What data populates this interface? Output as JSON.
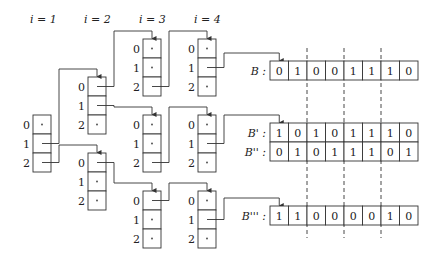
{
  "column_headers": [
    "i = 1",
    "i = 2",
    "i = 3",
    "i = 4"
  ],
  "slot_labels": [
    "0",
    "1",
    "2"
  ],
  "cell_placeholder": "·",
  "arrays": [
    {
      "name": "B",
      "label": "B :",
      "bits": [
        "0",
        "1",
        "0",
        "0",
        "1",
        "1",
        "1",
        "0"
      ]
    },
    {
      "name": "B'",
      "label": "B' :",
      "bits": [
        "1",
        "0",
        "1",
        "0",
        "1",
        "1",
        "1",
        "0"
      ]
    },
    {
      "name": "B''",
      "label": "B'' :",
      "bits": [
        "0",
        "1",
        "0",
        "1",
        "1",
        "1",
        "0",
        "1"
      ]
    },
    {
      "name": "B'''",
      "label": "B''' :",
      "bits": [
        "1",
        "1",
        "0",
        "0",
        "0",
        "0",
        "1",
        "0"
      ]
    }
  ],
  "nodes": [
    {
      "id": "n1",
      "column": 1,
      "pointers": {
        "1": "n2a",
        "2": "n2b"
      }
    },
    {
      "id": "n2a",
      "column": 2,
      "pointers": {
        "0": "n3a",
        "1": "n3b"
      }
    },
    {
      "id": "n2b",
      "column": 2,
      "pointers": {
        "0": "n3c"
      }
    },
    {
      "id": "n3a",
      "column": 3,
      "pointers": {
        "2": "n4a"
      }
    },
    {
      "id": "n3b",
      "column": 3,
      "pointers": {
        "2": "n4b"
      }
    },
    {
      "id": "n3c",
      "column": 3,
      "pointers": {
        "0": "n4c"
      }
    },
    {
      "id": "n4a",
      "column": 4,
      "pointers": {
        "1": "B"
      }
    },
    {
      "id": "n4b",
      "column": 4,
      "pointers": {
        "1": "B'"
      }
    },
    {
      "id": "n4c",
      "column": 4,
      "pointers": {
        "1": "B'''"
      }
    }
  ],
  "dashed_separators": 3
}
